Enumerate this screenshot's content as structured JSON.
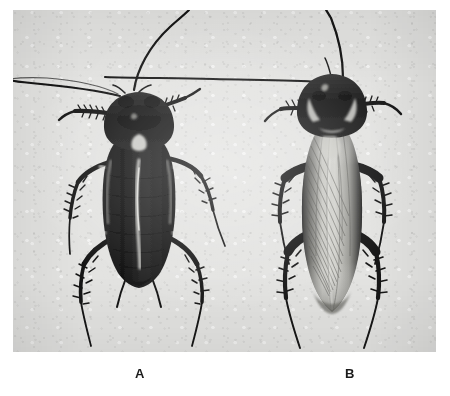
{
  "figure": {
    "kind": "photographic-plate",
    "background_color": "#e3e3e1",
    "page_color": "#ffffff",
    "specimen_color": "#1a1a1a",
    "wing_color": "#b9b9b5"
  },
  "photo": {
    "left": 13,
    "top": 10,
    "width": 423,
    "height": 342
  },
  "captions": [
    {
      "id": "a",
      "label": "A",
      "center_x": 127
    },
    {
      "id": "b",
      "label": "B",
      "center_x": 337
    }
  ],
  "specimens": [
    {
      "id": "a",
      "label": "A",
      "position": "left",
      "appearance": "dark uniformly blackish body, short wing pads leaving segmented abdomen exposed, pale pronotal marking, pale midline streak on abdomen",
      "center_x": 127,
      "antennae": 2,
      "legs": 6
    },
    {
      "id": "b",
      "label": "B",
      "position": "right",
      "appearance": "long fully developed wings with prominent venation covering the abdomen, pale bordered pronotum, darker lateral wing margins",
      "center_x": 337,
      "antennae": 2,
      "legs": 6
    }
  ]
}
